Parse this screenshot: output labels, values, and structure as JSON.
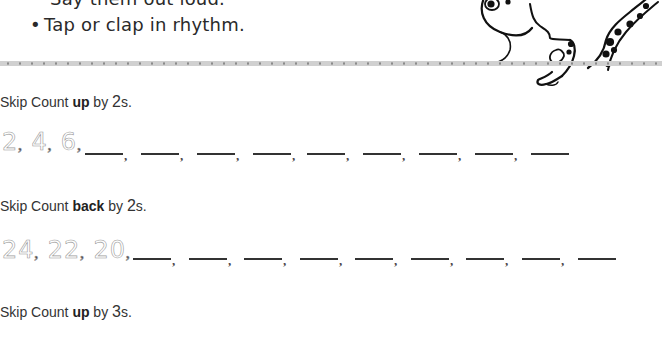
{
  "intro": {
    "cut_line": "Say them out loud.",
    "bullet": "•",
    "bullet_text": "Tap or clap in rhythm."
  },
  "exercises": [
    {
      "prefix": "Skip Count ",
      "direction": "up",
      "middle": " by ",
      "step": "2",
      "suffix": "s.",
      "traced": [
        "2",
        "4",
        "6"
      ],
      "blank_count": 9
    },
    {
      "prefix": "Skip Count ",
      "direction": "back",
      "middle": " by ",
      "step": "2",
      "suffix": "s.",
      "traced": [
        "24",
        "22",
        "20"
      ],
      "blank_count": 9
    },
    {
      "prefix": "Skip Count ",
      "direction": "up",
      "middle": " by ",
      "step": "3",
      "suffix": "s."
    }
  ],
  "illustration": {
    "icon": "frog-icon"
  },
  "colors": {
    "divider_band": "#d0d0d0",
    "divider_dots": "#8a8a8a",
    "traced_digits": "#9a9a9a"
  }
}
